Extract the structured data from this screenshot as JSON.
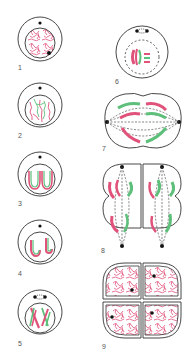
{
  "figure": {
    "colors": {
      "outline": "#333333",
      "chromosome_pink": "#e0527a",
      "chromosome_green": "#5dbf7a",
      "background": "#ffffff"
    },
    "stages": [
      {
        "label": "1",
        "phase": "interphase"
      },
      {
        "label": "2",
        "phase": "early-prophase"
      },
      {
        "label": "3",
        "phase": "prophase"
      },
      {
        "label": "4",
        "phase": "late-prophase"
      },
      {
        "label": "5",
        "phase": "prometaphase"
      },
      {
        "label": "6",
        "phase": "metaphase"
      },
      {
        "label": "7",
        "phase": "anaphase"
      },
      {
        "label": "8",
        "phase": "telophase"
      },
      {
        "label": "9",
        "phase": "cytokinesis"
      }
    ]
  }
}
